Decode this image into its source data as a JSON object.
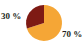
{
  "chart_data": {
    "type": "pie",
    "title": "",
    "subtitle": "",
    "xlabel": "",
    "ylabel": "",
    "grid": false,
    "legend_position": "none",
    "start_angle_deg": 90,
    "direction": "counterclockwise",
    "background_color": "#ffffff",
    "label_color": "#231f20",
    "categories": [
      "30 %",
      "70 %"
    ],
    "values": [
      30,
      70
    ],
    "slices": [
      {
        "label": "30 %",
        "value": 30,
        "color": "#7e1a14",
        "label_position": "outside-left"
      },
      {
        "label": "70 %",
        "value": 70,
        "color": "#f5a636",
        "label_position": "outside-bottom-right"
      }
    ]
  },
  "labels": {
    "left": "30 %",
    "right": "70 %"
  }
}
